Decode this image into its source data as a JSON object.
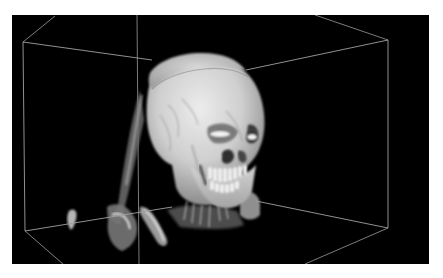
{
  "viewer": {
    "type": "3d-volume-rendering",
    "subject": "ct-skull",
    "background": "#000000",
    "box_line_color": "#9a9a9a",
    "bone_color_light": "#e6e6e6",
    "bone_color_mid": "#a8a8a8",
    "bone_color_dark": "#5a5a5a"
  }
}
